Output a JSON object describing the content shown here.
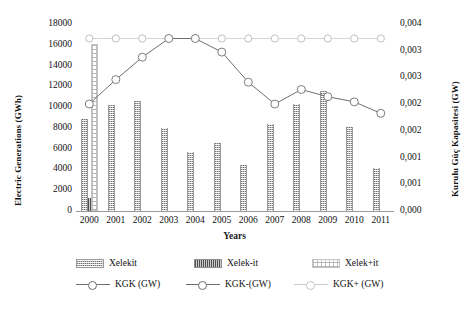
{
  "chart_data": {
    "type": "bar",
    "title": "",
    "xlabel": "Years",
    "ylabel": "Electric Generations (GWh)",
    "ylabel_secondary": "Kurulu Güç Kapasitesi (GW)",
    "categories": [
      "2000",
      "2001",
      "2002",
      "2003",
      "2004",
      "2005",
      "2006",
      "2007",
      "2008",
      "2009",
      "2010",
      "2011"
    ],
    "ylim": [
      0,
      18000
    ],
    "yticks": [
      "0",
      "2000",
      "4000",
      "6000",
      "8000",
      "10000",
      "12000",
      "14000",
      "16000",
      "18000"
    ],
    "ylim_secondary": [
      0,
      0.004
    ],
    "yticks_secondary": [
      "0,000",
      "0,001",
      "0,001",
      "0,002",
      "0,002",
      "0,003",
      "0,003",
      "0,004"
    ],
    "grid": false,
    "legend_position": "bottom",
    "series": [
      {
        "name": "Xelekit",
        "axis": "left",
        "kind": "bar",
        "values": [
          8900,
          10200,
          10600,
          8000,
          5700,
          6500,
          4400,
          8400,
          10300,
          11600,
          8100,
          4100
        ]
      },
      {
        "name": "Xelek-it",
        "axis": "left",
        "kind": "bar",
        "values": [
          1300,
          0,
          0,
          0,
          0,
          0,
          0,
          0,
          0,
          0,
          0,
          0
        ]
      },
      {
        "name": "Xelek+it",
        "axis": "left",
        "kind": "bar",
        "values": [
          15900,
          0,
          0,
          0,
          0,
          0,
          0,
          0,
          0,
          0,
          0,
          0
        ]
      },
      {
        "name": "KGK (GW)",
        "axis": "right",
        "kind": "line",
        "values": [
          10300,
          12650,
          14800,
          16600,
          16600,
          15300,
          12400,
          10300,
          11700,
          11000,
          10500,
          9400
        ]
      },
      {
        "name": "KGK-(GW)",
        "axis": "right",
        "kind": "line",
        "values": [
          10300,
          12650,
          14800,
          16600,
          16600,
          15300,
          12400,
          10300,
          11700,
          11000,
          10500,
          9400
        ]
      },
      {
        "name": "KGK+ (GW)",
        "axis": "right",
        "kind": "line",
        "values": [
          16600,
          16600,
          16600,
          16600,
          16600,
          16600,
          16600,
          16600,
          16600,
          16600,
          16600,
          16600
        ]
      }
    ]
  },
  "legend": {
    "items": [
      {
        "label": "Xelekit",
        "swatch": "sA",
        "kind": "bar"
      },
      {
        "label": "Xelek-it",
        "swatch": "sB",
        "kind": "bar"
      },
      {
        "label": "Xelek+it",
        "swatch": "sC",
        "kind": "bar"
      },
      {
        "label": "KGK (GW)",
        "swatch": "line-marker",
        "kind": "line"
      },
      {
        "label": "KGK-(GW)",
        "swatch": "line-marker",
        "kind": "line"
      },
      {
        "label": "KGK+ (GW)",
        "swatch": "line-flat",
        "kind": "line"
      }
    ]
  },
  "colors": {
    "line_dark": "#6f6f6f",
    "line_light": "#c9c9c9",
    "axis": "#9a9a9a",
    "text": "#111111",
    "background": "#ffffff"
  }
}
